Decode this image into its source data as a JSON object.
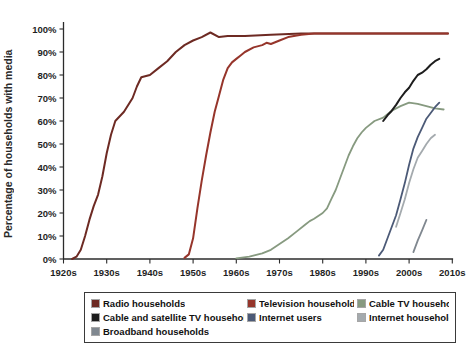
{
  "chart_data": {
    "type": "line",
    "title": "",
    "xlabel": "",
    "ylabel": "Percentage of households with media",
    "xlim": [
      1920,
      2012
    ],
    "ylim": [
      0,
      100
    ],
    "grid": false,
    "legend_position": "bottom",
    "x_ticks": [
      {
        "year": 1920,
        "label": "1920s"
      },
      {
        "year": 1930,
        "label": "1930s"
      },
      {
        "year": 1940,
        "label": "1940s"
      },
      {
        "year": 1950,
        "label": "1950s"
      },
      {
        "year": 1960,
        "label": "1960s"
      },
      {
        "year": 1970,
        "label": "1970s"
      },
      {
        "year": 1980,
        "label": "1980s"
      },
      {
        "year": 1990,
        "label": "1990s"
      },
      {
        "year": 2000,
        "label": "2000s"
      },
      {
        "year": 2010,
        "label": "2010s"
      }
    ],
    "y_ticks": [
      {
        "value": 0,
        "label": "0%"
      },
      {
        "value": 10,
        "label": "10%"
      },
      {
        "value": 20,
        "label": "20%"
      },
      {
        "value": 30,
        "label": "30%"
      },
      {
        "value": 40,
        "label": "40%"
      },
      {
        "value": 50,
        "label": "50%"
      },
      {
        "value": 60,
        "label": "60%"
      },
      {
        "value": 70,
        "label": "70%"
      },
      {
        "value": 80,
        "label": "80%"
      },
      {
        "value": 90,
        "label": "90%"
      },
      {
        "value": 100,
        "label": "100%"
      }
    ],
    "series": [
      {
        "key": "radio-households",
        "name": "Radio households",
        "color": "#6d2a23",
        "width": 2,
        "points": [
          [
            1922,
            0
          ],
          [
            1923,
            1
          ],
          [
            1924,
            4
          ],
          [
            1925,
            10
          ],
          [
            1926,
            17
          ],
          [
            1927,
            23
          ],
          [
            1928,
            28
          ],
          [
            1929,
            36
          ],
          [
            1930,
            46
          ],
          [
            1931,
            54
          ],
          [
            1932,
            60
          ],
          [
            1934,
            64
          ],
          [
            1936,
            70
          ],
          [
            1937,
            75
          ],
          [
            1938,
            79
          ],
          [
            1940,
            80
          ],
          [
            1942,
            83
          ],
          [
            1944,
            86
          ],
          [
            1946,
            90
          ],
          [
            1948,
            93
          ],
          [
            1950,
            95
          ],
          [
            1952,
            96.5
          ],
          [
            1954,
            98.5
          ],
          [
            1956,
            96.5
          ],
          [
            1958,
            97
          ],
          [
            1962,
            97
          ],
          [
            1968,
            97.5
          ],
          [
            1975,
            98
          ],
          [
            1985,
            98
          ],
          [
            1995,
            98
          ],
          [
            2009,
            98
          ]
        ]
      },
      {
        "key": "television-households",
        "name": "Television households",
        "color": "#96352b",
        "width": 2,
        "points": [
          [
            1948,
            0.5
          ],
          [
            1949,
            2
          ],
          [
            1950,
            9
          ],
          [
            1951,
            22
          ],
          [
            1952,
            34
          ],
          [
            1953,
            45
          ],
          [
            1954,
            55
          ],
          [
            1955,
            64
          ],
          [
            1956,
            71
          ],
          [
            1957,
            78
          ],
          [
            1958,
            83
          ],
          [
            1959,
            85.5
          ],
          [
            1960,
            87
          ],
          [
            1961,
            88.5
          ],
          [
            1962,
            90
          ],
          [
            1964,
            92
          ],
          [
            1966,
            93
          ],
          [
            1967,
            94
          ],
          [
            1968,
            93.5
          ],
          [
            1970,
            95
          ],
          [
            1972,
            96.5
          ],
          [
            1975,
            97.5
          ],
          [
            1978,
            98
          ],
          [
            1990,
            98
          ],
          [
            2000,
            98
          ],
          [
            2009,
            98
          ]
        ]
      },
      {
        "key": "cable-tv-households",
        "name": "Cable TV households",
        "color": "#879a80",
        "width": 1.8,
        "points": [
          [
            1960,
            0.3
          ],
          [
            1963,
            1
          ],
          [
            1966,
            2.5
          ],
          [
            1968,
            4
          ],
          [
            1970,
            6.5
          ],
          [
            1972,
            9
          ],
          [
            1974,
            12
          ],
          [
            1976,
            15
          ],
          [
            1977,
            16.5
          ],
          [
            1978,
            17.5
          ],
          [
            1980,
            20
          ],
          [
            1981,
            22
          ],
          [
            1982,
            26
          ],
          [
            1983,
            30
          ],
          [
            1984,
            35
          ],
          [
            1985,
            40
          ],
          [
            1986,
            45
          ],
          [
            1987,
            49
          ],
          [
            1988,
            52.5
          ],
          [
            1989,
            55
          ],
          [
            1990,
            57
          ],
          [
            1992,
            60
          ],
          [
            1994,
            61.5
          ],
          [
            1996,
            64.5
          ],
          [
            1998,
            66.5
          ],
          [
            2000,
            68
          ],
          [
            2002,
            67.5
          ],
          [
            2004,
            66.5
          ],
          [
            2006,
            65.5
          ],
          [
            2008,
            65
          ]
        ]
      },
      {
        "key": "cable-satellite-tv-households",
        "name": "Cable and satellite TV households",
        "color": "#1d1d1d",
        "width": 2,
        "points": [
          [
            1994,
            60
          ],
          [
            1995,
            62.5
          ],
          [
            1996,
            64.5
          ],
          [
            1997,
            67
          ],
          [
            1998,
            70
          ],
          [
            1999,
            72.5
          ],
          [
            2000,
            74.5
          ],
          [
            2001,
            77.5
          ],
          [
            2002,
            80
          ],
          [
            2003,
            81
          ],
          [
            2004,
            82.5
          ],
          [
            2005,
            84.5
          ],
          [
            2006,
            86
          ],
          [
            2007,
            87
          ]
        ]
      },
      {
        "key": "internet-users",
        "name": "Internet users",
        "color": "#4c5a77",
        "width": 1.8,
        "points": [
          [
            1993,
            1.5
          ],
          [
            1994,
            4
          ],
          [
            1995,
            9
          ],
          [
            1996,
            14
          ],
          [
            1997,
            19
          ],
          [
            1998,
            26
          ],
          [
            1999,
            33
          ],
          [
            2000,
            41
          ],
          [
            2001,
            48
          ],
          [
            2002,
            53
          ],
          [
            2003,
            57
          ],
          [
            2004,
            61
          ],
          [
            2005,
            63.5
          ],
          [
            2006,
            66
          ],
          [
            2007,
            68
          ]
        ]
      },
      {
        "key": "internet-households",
        "name": "Internet households",
        "color": "#a4aaae",
        "width": 1.8,
        "points": [
          [
            1997,
            14
          ],
          [
            1998,
            20
          ],
          [
            1999,
            26
          ],
          [
            2000,
            33
          ],
          [
            2001,
            39
          ],
          [
            2002,
            44
          ],
          [
            2003,
            47
          ],
          [
            2004,
            50
          ],
          [
            2005,
            52.5
          ],
          [
            2006,
            54
          ]
        ]
      },
      {
        "key": "broadband-households",
        "name": "Broadband households",
        "color": "#808890",
        "width": 1.8,
        "points": [
          [
            2001,
            3
          ],
          [
            2002,
            8
          ],
          [
            2003,
            12.5
          ],
          [
            2004,
            17
          ]
        ]
      }
    ]
  }
}
